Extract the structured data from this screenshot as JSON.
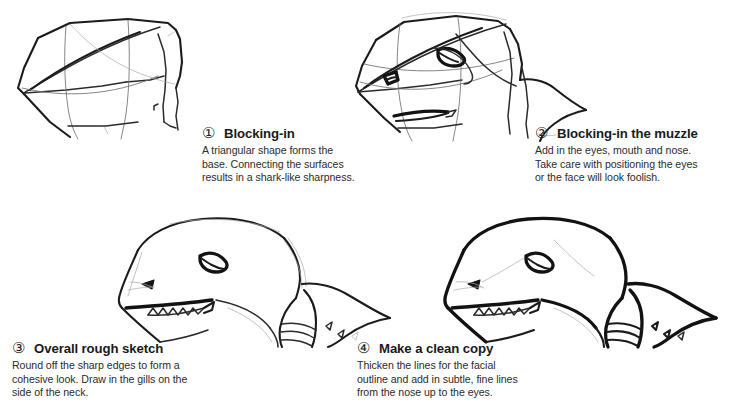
{
  "page": {
    "kind": "drawing-tutorial",
    "background_color": "#ffffff",
    "ink_color": "#1b1b1b",
    "text_color": "#231f20"
  },
  "steps": [
    {
      "number": "①",
      "number_plain": "1",
      "title": "Blocking-in",
      "body_lines": [
        "A triangular shape forms the",
        "base. Connecting the surfaces",
        "results in a shark-like sharpness."
      ],
      "figure_name": "shark-head-stage-1-blocking-in"
    },
    {
      "number": "②",
      "number_plain": "2",
      "title": "Blocking-in the muzzle",
      "body_lines": [
        "Add in the eyes, mouth and nose.",
        "Take care with positioning the eyes",
        "or the face will look foolish."
      ],
      "figure_name": "shark-head-stage-2-muzzle"
    },
    {
      "number": "③",
      "number_plain": "3",
      "title": "Overall rough sketch",
      "body_lines": [
        "Round off the sharp edges to form a",
        "cohesive look. Draw in the gills on the",
        "side of the neck."
      ],
      "figure_name": "shark-head-stage-3-rough-sketch"
    },
    {
      "number": "④",
      "number_plain": "4",
      "title": "Make a clean copy",
      "body_lines": [
        "Thicken the lines for the facial",
        "outline and add in subtle, fine lines",
        "from the nose up to the eyes."
      ],
      "figure_name": "shark-head-stage-4-clean-copy"
    }
  ]
}
